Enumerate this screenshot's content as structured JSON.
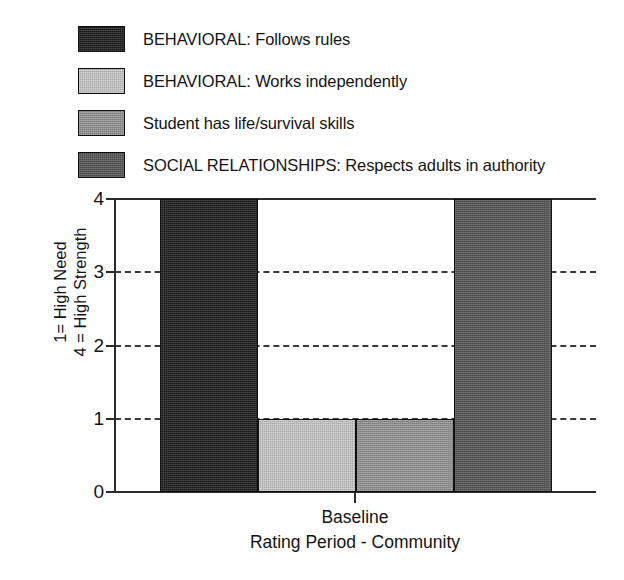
{
  "chart_data": {
    "type": "bar",
    "title": "",
    "subtitle": "",
    "categories": [
      "Baseline"
    ],
    "xlabel": "Rating Period - Community",
    "ylabel_line1": "1= High Need",
    "ylabel_line2": "4 = High Strength",
    "ylim": [
      0,
      4
    ],
    "yticks": [
      0,
      1,
      2,
      3,
      4
    ],
    "ytick_labels": [
      "0",
      "1",
      "2",
      "3",
      "4"
    ],
    "gridlines_at": [
      1,
      2,
      3
    ],
    "grid": "dashed-horizontal",
    "legend_position": "above-plot",
    "series": [
      {
        "name": "BEHAVIORAL: Follows rules",
        "values": [
          4
        ],
        "color": "#1d1d1d"
      },
      {
        "name": "BEHAVIORAL: Works independently",
        "values": [
          1
        ],
        "color": "#c9c9c9"
      },
      {
        "name": "Student has life/survival skills",
        "values": [
          1
        ],
        "color": "#949494"
      },
      {
        "name": "SOCIAL RELATIONSHIPS: Respects adults in authority",
        "values": [
          4
        ],
        "color": "#555555"
      }
    ]
  },
  "legend": {
    "items": [
      {
        "label": "BEHAVIORAL: Follows rules",
        "color": "#1d1d1d"
      },
      {
        "label": "BEHAVIORAL: Works independently",
        "color": "#c9c9c9"
      },
      {
        "label": "Student has life/survival skills",
        "color": "#949494"
      },
      {
        "label": "SOCIAL RELATIONSHIPS: Respects adults in authority",
        "color": "#555555"
      }
    ]
  },
  "axes": {
    "y": {
      "labels": [
        "4",
        "3",
        "2",
        "1",
        "0"
      ],
      "title_line1": "1= High Need",
      "title_line2": "4 = High Strength"
    },
    "x": {
      "tick_label": "Baseline",
      "title": "Rating Period - Community"
    }
  }
}
